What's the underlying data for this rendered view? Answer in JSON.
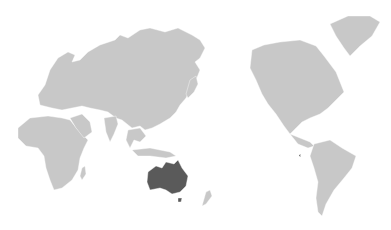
{
  "map": {
    "projection": "Pacific-centered world map",
    "highlighted_region": "Australia",
    "colors": {
      "background": "#ffffff",
      "land": "#c8c8c8",
      "highlight": "#5a5a5a"
    }
  }
}
